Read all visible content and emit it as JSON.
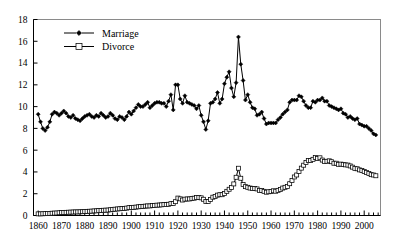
{
  "chart_data": {
    "type": "line",
    "title": "",
    "subtitle": "",
    "xlabel": "",
    "ylabel": "",
    "xlim": [
      1858,
      2007
    ],
    "ylim": [
      0,
      18
    ],
    "ytick_step": 2,
    "xtick_step": 10,
    "grid": false,
    "legend_position": "top-left",
    "yticks": [
      "0",
      "2",
      "4",
      "6",
      "8",
      "10",
      "12",
      "14",
      "16",
      "18"
    ],
    "xticks": [
      "1860",
      "1870",
      "1880",
      "1890",
      "1900",
      "1910",
      "1920",
      "1930",
      "1940",
      "1950",
      "1960",
      "1970",
      "1980",
      "1990",
      "2000"
    ],
    "series": [
      {
        "name": "Marriage",
        "marker": "filled-diamond",
        "color": "#000000",
        "x": [
          1860,
          1861,
          1862,
          1863,
          1864,
          1865,
          1866,
          1867,
          1868,
          1869,
          1870,
          1871,
          1872,
          1873,
          1874,
          1875,
          1876,
          1877,
          1878,
          1879,
          1880,
          1881,
          1882,
          1883,
          1884,
          1885,
          1886,
          1887,
          1888,
          1889,
          1890,
          1891,
          1892,
          1893,
          1894,
          1895,
          1896,
          1897,
          1898,
          1899,
          1900,
          1901,
          1902,
          1903,
          1904,
          1905,
          1906,
          1907,
          1908,
          1909,
          1910,
          1911,
          1912,
          1913,
          1914,
          1915,
          1916,
          1917,
          1918,
          1919,
          1920,
          1921,
          1922,
          1923,
          1924,
          1925,
          1926,
          1927,
          1928,
          1929,
          1930,
          1931,
          1932,
          1933,
          1934,
          1935,
          1936,
          1937,
          1938,
          1939,
          1940,
          1941,
          1942,
          1943,
          1944,
          1945,
          1946,
          1947,
          1948,
          1949,
          1950,
          1951,
          1952,
          1953,
          1954,
          1955,
          1956,
          1957,
          1958,
          1959,
          1960,
          1961,
          1962,
          1963,
          1964,
          1965,
          1966,
          1967,
          1968,
          1969,
          1970,
          1971,
          1972,
          1973,
          1974,
          1975,
          1976,
          1977,
          1978,
          1979,
          1980,
          1981,
          1982,
          1983,
          1984,
          1985,
          1986,
          1987,
          1988,
          1989,
          1990,
          1991,
          1992,
          1993,
          1994,
          1995,
          1996,
          1997,
          1998,
          1999,
          2000,
          2001,
          2002,
          2003,
          2004,
          2005
        ],
        "y": [
          9.3,
          8.6,
          8.0,
          7.8,
          8.1,
          8.6,
          9.3,
          9.5,
          9.4,
          9.2,
          9.4,
          9.6,
          9.4,
          9.1,
          9.0,
          9.2,
          8.9,
          8.8,
          8.7,
          8.9,
          9.1,
          9.2,
          9.3,
          9.1,
          9.0,
          9.2,
          9.1,
          9.4,
          9.2,
          9.0,
          9.1,
          9.4,
          9.2,
          8.9,
          8.8,
          9.1,
          9.0,
          8.8,
          9.1,
          9.5,
          9.3,
          9.6,
          9.9,
          10.2,
          10.0,
          10.0,
          10.2,
          10.4,
          9.9,
          10.1,
          10.3,
          10.4,
          10.4,
          10.3,
          10.3,
          10.0,
          10.5,
          11.1,
          9.7,
          12.0,
          12.0,
          10.7,
          10.3,
          11.0,
          10.4,
          10.3,
          10.2,
          10.1,
          9.8,
          10.1,
          9.2,
          8.6,
          7.9,
          8.7,
          10.3,
          10.4,
          10.7,
          11.3,
          10.3,
          10.7,
          12.1,
          12.7,
          13.2,
          11.7,
          10.9,
          12.2,
          16.4,
          13.9,
          12.4,
          10.6,
          11.1,
          10.4,
          9.9,
          9.8,
          9.2,
          9.3,
          9.5,
          8.9,
          8.4,
          8.5,
          8.5,
          8.5,
          8.5,
          8.8,
          9.0,
          9.3,
          9.5,
          9.7,
          10.4,
          10.6,
          10.6,
          10.6,
          11.0,
          10.9,
          10.5,
          10.1,
          9.9,
          9.9,
          10.5,
          10.4,
          10.6,
          10.6,
          10.8,
          10.5,
          10.5,
          10.1,
          10.0,
          9.9,
          9.8,
          9.7,
          9.8,
          9.4,
          9.3,
          9.0,
          9.1,
          8.9,
          8.8,
          8.9,
          8.4,
          8.3,
          8.2,
          8.2,
          8.0,
          7.8,
          7.5,
          7.4
        ]
      },
      {
        "name": "Divorce",
        "marker": "open-square",
        "color": "#000000",
        "x": [
          1860,
          1861,
          1862,
          1863,
          1864,
          1865,
          1866,
          1867,
          1868,
          1869,
          1870,
          1871,
          1872,
          1873,
          1874,
          1875,
          1876,
          1877,
          1878,
          1879,
          1880,
          1881,
          1882,
          1883,
          1884,
          1885,
          1886,
          1887,
          1888,
          1889,
          1890,
          1891,
          1892,
          1893,
          1894,
          1895,
          1896,
          1897,
          1898,
          1899,
          1900,
          1901,
          1902,
          1903,
          1904,
          1905,
          1906,
          1907,
          1908,
          1909,
          1910,
          1911,
          1912,
          1913,
          1914,
          1915,
          1916,
          1917,
          1918,
          1919,
          1920,
          1921,
          1922,
          1923,
          1924,
          1925,
          1926,
          1927,
          1928,
          1929,
          1930,
          1931,
          1932,
          1933,
          1934,
          1935,
          1936,
          1937,
          1938,
          1939,
          1940,
          1941,
          1942,
          1943,
          1944,
          1945,
          1946,
          1947,
          1948,
          1949,
          1950,
          1951,
          1952,
          1953,
          1954,
          1955,
          1956,
          1957,
          1958,
          1959,
          1960,
          1961,
          1962,
          1963,
          1964,
          1965,
          1966,
          1967,
          1968,
          1969,
          1970,
          1971,
          1972,
          1973,
          1974,
          1975,
          1976,
          1977,
          1978,
          1979,
          1980,
          1981,
          1982,
          1983,
          1984,
          1985,
          1986,
          1987,
          1988,
          1989,
          1990,
          1991,
          1992,
          1993,
          1994,
          1995,
          1996,
          1997,
          1998,
          1999,
          2000,
          2001,
          2002,
          2003,
          2004,
          2005
        ],
        "y": [
          0.15,
          0.15,
          0.16,
          0.17,
          0.18,
          0.19,
          0.21,
          0.22,
          0.23,
          0.25,
          0.27,
          0.28,
          0.29,
          0.3,
          0.31,
          0.32,
          0.33,
          0.33,
          0.34,
          0.35,
          0.37,
          0.38,
          0.39,
          0.4,
          0.42,
          0.43,
          0.45,
          0.46,
          0.48,
          0.49,
          0.5,
          0.53,
          0.56,
          0.58,
          0.6,
          0.62,
          0.64,
          0.65,
          0.68,
          0.72,
          0.73,
          0.75,
          0.77,
          0.8,
          0.82,
          0.84,
          0.86,
          0.88,
          0.88,
          0.91,
          0.93,
          0.95,
          0.96,
          0.98,
          1.0,
          1.0,
          1.03,
          1.09,
          1.11,
          1.27,
          1.6,
          1.53,
          1.42,
          1.5,
          1.52,
          1.52,
          1.56,
          1.59,
          1.65,
          1.66,
          1.62,
          1.49,
          1.29,
          1.29,
          1.48,
          1.68,
          1.75,
          1.87,
          1.91,
          1.91,
          2.01,
          2.22,
          2.41,
          2.56,
          2.9,
          3.51,
          4.34,
          3.42,
          2.84,
          2.65,
          2.59,
          2.52,
          2.47,
          2.48,
          2.44,
          2.31,
          2.3,
          2.22,
          2.14,
          2.18,
          2.21,
          2.27,
          2.23,
          2.31,
          2.38,
          2.52,
          2.59,
          2.66,
          2.92,
          3.21,
          3.54,
          3.72,
          4.05,
          4.35,
          4.62,
          4.86,
          5.04,
          5.04,
          5.16,
          5.32,
          5.24,
          5.3,
          5.09,
          4.96,
          4.98,
          5.02,
          4.94,
          4.8,
          4.8,
          4.7,
          4.72,
          4.69,
          4.65,
          4.63,
          4.55,
          4.44,
          4.33,
          4.29,
          4.19,
          4.13,
          4.05,
          3.95,
          3.86,
          3.75,
          3.72,
          3.65
        ]
      }
    ]
  },
  "legend": {
    "entries": [
      {
        "label": "Marriage",
        "marker": "filled-diamond"
      },
      {
        "label": "Divorce",
        "marker": "open-square"
      }
    ]
  }
}
